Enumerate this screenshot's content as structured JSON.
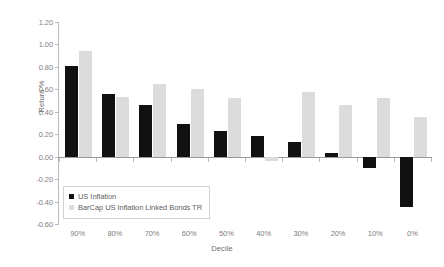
{
  "chart_data": {
    "type": "bar",
    "title": "",
    "xlabel": "Decile",
    "ylabel": "Return %",
    "categories": [
      "90%",
      "80%",
      "70%",
      "60%",
      "50%",
      "40%",
      "30%",
      "20%",
      "10%",
      "0%"
    ],
    "series": [
      {
        "name": "US Inflation",
        "color": "#111111",
        "values": [
          0.81,
          0.56,
          0.46,
          0.29,
          0.23,
          0.18,
          0.13,
          0.03,
          -0.1,
          -0.45
        ]
      },
      {
        "name": "BarCap US Inflation Linked Bonds TR",
        "color": "#dcdcdc",
        "values": [
          0.94,
          0.53,
          0.65,
          0.6,
          0.52,
          -0.04,
          0.58,
          0.46,
          0.52,
          0.35
        ]
      }
    ],
    "ylim": [
      -0.6,
      1.2
    ],
    "ytick_values": [
      1.2,
      1.0,
      0.8,
      0.6,
      0.4,
      0.2,
      0.0,
      -0.2,
      -0.4,
      -0.6
    ],
    "ytick_labels": [
      "1.20",
      "1.00",
      "0.80",
      "0.60",
      "0.40",
      "0.20",
      "0.00",
      "-0.20",
      "-0.40",
      "-0.60"
    ],
    "grid": false,
    "legend_position": "inside-lower-left"
  }
}
